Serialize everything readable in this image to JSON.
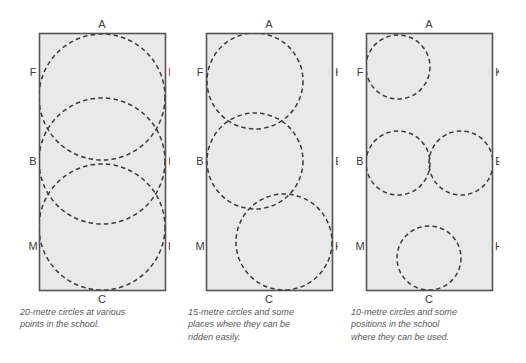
{
  "figure": {
    "title_hidden": "",
    "background_color": "#ffffff",
    "arena_fill": "#e8e8e8",
    "arena_stroke": "#555555",
    "circle_stroke": "#3a3a3a",
    "label_color": "#3c3c3c",
    "caption_color": "#5a5a5a"
  },
  "panels": [
    {
      "id": "panel-20m",
      "markers": {
        "A": "A",
        "C": "C",
        "F": "F",
        "K": "K",
        "B": "B",
        "E": "E",
        "M": "M",
        "H": "H"
      },
      "circle_size_label": "20-metre",
      "circles": [
        {
          "name": "circle-top",
          "cx": 65,
          "cy": 64,
          "r": 63
        },
        {
          "name": "circle-middle",
          "cx": 65,
          "cy": 127,
          "r": 63
        },
        {
          "name": "circle-bottom",
          "cx": 65,
          "cy": 194,
          "r": 63
        }
      ],
      "caption_lines": [
        "20-metre circles at various",
        "points in the school."
      ]
    },
    {
      "id": "panel-15m",
      "markers": {
        "A": "A",
        "C": "C",
        "F": "F",
        "K": "K",
        "B": "B",
        "E": "E",
        "M": "M",
        "H": "H"
      },
      "circle_size_label": "15-metre",
      "circles": [
        {
          "name": "circle-top-left",
          "cx": 49,
          "cy": 48,
          "r": 48
        },
        {
          "name": "circle-middle",
          "cx": 49,
          "cy": 128,
          "r": 48
        },
        {
          "name": "circle-bottom-right",
          "cx": 78,
          "cy": 209,
          "r": 48
        }
      ],
      "caption_lines": [
        "15-metre circles and some",
        "places where they can be",
        "ridden easily."
      ]
    },
    {
      "id": "panel-10m",
      "markers": {
        "A": "A",
        "C": "C",
        "F": "F",
        "K": "K",
        "B": "B",
        "E": "E",
        "M": "M",
        "H": "H"
      },
      "circle_size_label": "10-metre",
      "circles": [
        {
          "name": "circle-top-left",
          "cx": 33,
          "cy": 34,
          "r": 32
        },
        {
          "name": "circle-middle-left",
          "cx": 33,
          "cy": 130,
          "r": 32
        },
        {
          "name": "circle-middle-right",
          "cx": 96,
          "cy": 130,
          "r": 32
        },
        {
          "name": "circle-bottom-centre",
          "cx": 63,
          "cy": 225,
          "r": 32
        }
      ],
      "caption_lines": [
        "10-metre circles and some",
        "positions in the school",
        "where they can be used."
      ]
    }
  ],
  "marker_layout": {
    "A_top": "A",
    "C_bottom": "C",
    "left_labels": [
      "F",
      "B",
      "M"
    ],
    "right_labels": [
      "K",
      "E",
      "H"
    ]
  }
}
